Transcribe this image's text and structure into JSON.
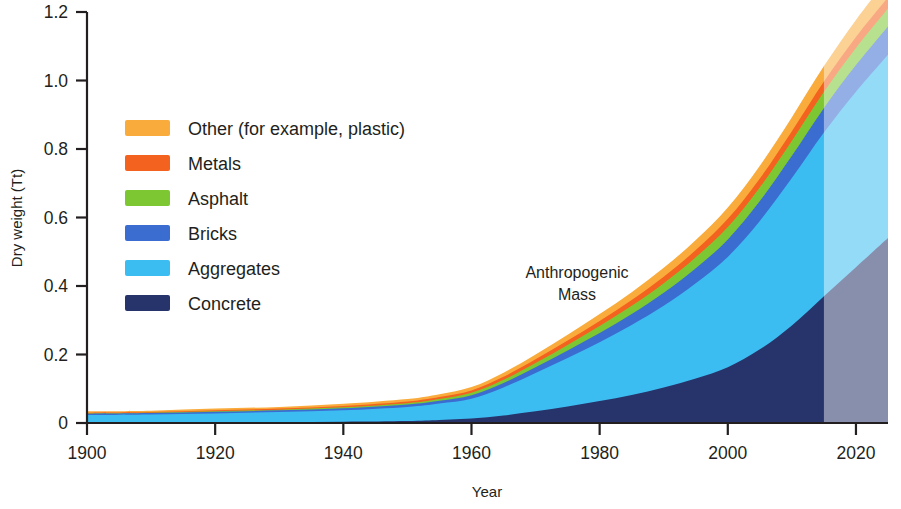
{
  "chart_data": {
    "type": "area",
    "stacked": true,
    "title": "",
    "subtitle": "",
    "xlabel": "Year",
    "ylabel": "Dry weight (Tt)",
    "xlim": [
      1900,
      2025
    ],
    "ylim": [
      0,
      1.2
    ],
    "xticks": [
      1900,
      1920,
      1940,
      1960,
      1980,
      2000,
      2020
    ],
    "xtick_labels": [
      "1900",
      "1920",
      "1940",
      "1960",
      "1980",
      "2000",
      "2020"
    ],
    "yticks": [
      0,
      0.2,
      0.4,
      0.6,
      0.8,
      1.0,
      1.2
    ],
    "ytick_labels": [
      "0",
      "0.2",
      "0.4",
      "0.6",
      "0.8",
      "1.0",
      "1.2"
    ],
    "grid": false,
    "legend_position": "upper-left",
    "annotations": [
      {
        "text_line1": "Anthropogenic",
        "text_line2": "Mass",
        "x": 1986,
        "y": 0.44
      }
    ],
    "projection_start_year": 2015,
    "projection_note": "shaded/faded overlay from 2015 onward",
    "x": [
      1900,
      1910,
      1920,
      1930,
      1940,
      1950,
      1955,
      1960,
      1965,
      1970,
      1975,
      1980,
      1985,
      1990,
      1995,
      2000,
      2005,
      2010,
      2015,
      2020,
      2025
    ],
    "series": [
      {
        "name": "Concrete",
        "color": "#27336b",
        "values": [
          0.001,
          0.001,
          0.002,
          0.003,
          0.004,
          0.006,
          0.009,
          0.013,
          0.022,
          0.034,
          0.048,
          0.064,
          0.082,
          0.104,
          0.13,
          0.163,
          0.215,
          0.285,
          0.37,
          0.455,
          0.54
        ]
      },
      {
        "name": "Aggregates",
        "color": "#3cbdf2",
        "values": [
          0.022,
          0.024,
          0.026,
          0.029,
          0.033,
          0.041,
          0.048,
          0.058,
          0.082,
          0.112,
          0.142,
          0.172,
          0.204,
          0.238,
          0.278,
          0.322,
          0.375,
          0.43,
          0.478,
          0.512,
          0.535
        ]
      },
      {
        "name": "Bricks",
        "color": "#3b6dd1",
        "values": [
          0.004,
          0.004,
          0.005,
          0.005,
          0.006,
          0.007,
          0.008,
          0.01,
          0.013,
          0.017,
          0.022,
          0.027,
          0.032,
          0.038,
          0.044,
          0.051,
          0.058,
          0.065,
          0.072,
          0.078,
          0.083
        ]
      },
      {
        "name": "Asphalt",
        "color": "#7dc832",
        "values": [
          0.001,
          0.001,
          0.001,
          0.002,
          0.003,
          0.004,
          0.005,
          0.007,
          0.009,
          0.012,
          0.016,
          0.02,
          0.024,
          0.028,
          0.032,
          0.036,
          0.04,
          0.044,
          0.047,
          0.05,
          0.052
        ]
      },
      {
        "name": "Metals",
        "color": "#f4621f",
        "values": [
          0.002,
          0.002,
          0.003,
          0.003,
          0.004,
          0.005,
          0.006,
          0.007,
          0.009,
          0.011,
          0.013,
          0.015,
          0.017,
          0.019,
          0.021,
          0.024,
          0.026,
          0.028,
          0.03,
          0.032,
          0.033
        ]
      },
      {
        "name": "Other (for example, plastic)",
        "color": "#f9ac3c",
        "values": [
          0.004,
          0.004,
          0.005,
          0.005,
          0.006,
          0.007,
          0.008,
          0.01,
          0.012,
          0.014,
          0.017,
          0.02,
          0.023,
          0.026,
          0.029,
          0.033,
          0.037,
          0.041,
          0.045,
          0.05,
          0.055
        ]
      }
    ],
    "totals_at_ticks": {
      "1900": 0.034,
      "1920": 0.042,
      "1940": 0.056,
      "1960": 0.105,
      "1980": 0.318,
      "2000": 0.629,
      "2020": 1.177,
      "2025": 1.298
    }
  },
  "legend": {
    "items": [
      {
        "label": "Other (for example, plastic)",
        "color": "#f9ac3c"
      },
      {
        "label": "Metals",
        "color": "#f4621f"
      },
      {
        "label": "Asphalt",
        "color": "#7dc832"
      },
      {
        "label": "Bricks",
        "color": "#3b6dd1"
      },
      {
        "label": "Aggregates",
        "color": "#3cbdf2"
      },
      {
        "label": "Concrete",
        "color": "#27336b"
      }
    ]
  },
  "axes": {
    "y_title": "Dry weight (Tt)",
    "x_title": "Year",
    "y_ticks": [
      "1.2",
      "1.0",
      "0.8",
      "0.6",
      "0.4",
      "0.2",
      "0"
    ],
    "x_ticks": [
      "1900",
      "1920",
      "1940",
      "1960",
      "1980",
      "2000",
      "2020"
    ]
  },
  "annotation": {
    "line1": "Anthropogenic",
    "line2": "Mass"
  },
  "colors": {
    "axis": "#231f20",
    "background": "#ffffff",
    "projection_veil": "rgba(255,255,255,0.45)"
  }
}
